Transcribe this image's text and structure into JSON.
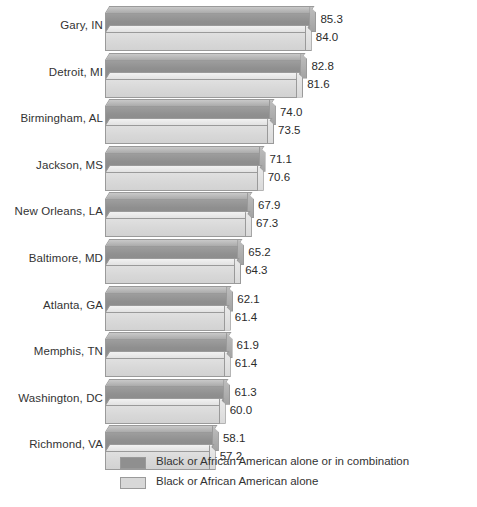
{
  "chart_data": {
    "type": "bar",
    "title": "",
    "xlabel": "",
    "ylabel": "",
    "orientation": "horizontal",
    "grid": false,
    "legend_position": "bottom",
    "xlim": [
      28,
      90
    ],
    "categories": [
      "Gary, IN",
      "Detroit, MI",
      "Birmingham, AL",
      "Jackson, MS",
      "New Orleans, LA",
      "Baltimore, MD",
      "Atlanta, GA",
      "Memphis, TN",
      "Washington, DC",
      "Richmond, VA"
    ],
    "series": [
      {
        "name": "Black or African American alone or in combination",
        "color": "#8f8f8f",
        "values": [
          85.3,
          82.8,
          74.0,
          71.1,
          67.9,
          65.2,
          62.1,
          61.9,
          61.3,
          58.1
        ],
        "labels": [
          "85.3",
          "82.8",
          "74.0",
          "71.1",
          "67.9",
          "65.2",
          "62.1",
          "61.9",
          "61.3",
          "58.1"
        ]
      },
      {
        "name": "Black or African American alone",
        "color": "#d8d8d8",
        "values": [
          84.0,
          81.6,
          73.5,
          70.6,
          67.3,
          64.3,
          61.4,
          61.4,
          60.0,
          57.2
        ],
        "labels": [
          "84.0",
          "81.6",
          "73.5",
          "70.6",
          "67.3",
          "64.3",
          "61.4",
          "61.4",
          "60.0",
          "57.2"
        ]
      }
    ]
  }
}
